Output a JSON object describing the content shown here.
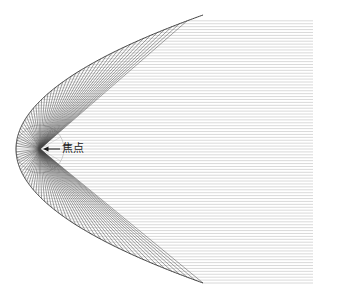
{
  "figure": {
    "kind": "parabolic-reflector-ray-diagram",
    "background_color": "#ffffff",
    "width": 338,
    "height": 297
  },
  "labels": {
    "focus_label": "焦点",
    "focus_label_x": 62,
    "focus_label_y": 149,
    "arrow_tip_x": 43,
    "arrow_tail_x": 60,
    "arrow_y": 149,
    "arrow_color": "#1a1a1a"
  },
  "chart_data": {
    "type": "line",
    "title": "",
    "subtitle": "",
    "xlabel": "",
    "ylabel": "",
    "grid": false,
    "legend": "none",
    "annotations": [
      {
        "text": "焦点",
        "x": 40,
        "y": 149,
        "arrow": "left-pointing",
        "label_offset_x": 22
      }
    ],
    "geometry": {
      "parabola": {
        "vertex_x": 16,
        "vertex_y": 149,
        "focus_x": 40,
        "focus_y": 149,
        "focal_length": 24,
        "opens": "right",
        "axis": "horizontal",
        "right_edge_x": 313,
        "top_y": 20,
        "bottom_y": 283,
        "equation": "y^2 = 4 * 24 * (x - 16)",
        "stroke": "#2b2b2b",
        "stroke_width": 0.9
      },
      "focus_circle": {
        "center_x": 40,
        "center_y": 149,
        "radius": 24,
        "stroke": "#9a9a9a",
        "stroke_width": 0.5,
        "note": "construction circle of radius = focal length centred on focus"
      },
      "incoming_rays": {
        "description": "horizontal parallel rays travelling leftwards toward the reflector",
        "count": 46,
        "x_start": 313,
        "spacing_y": 11.4,
        "y_min": 20,
        "y_max": 283,
        "stroke": "#b9b9b9",
        "stroke_width": 0.55
      },
      "reflected_rays": {
        "description": "each incoming ray reflects off the parabola and passes through the focus",
        "count": 46,
        "converge_x": 40,
        "converge_y": 149,
        "stroke": "#444444",
        "stroke_width": 0.5
      },
      "construction_lines": {
        "description": "faint radial spokes from focus to the construction circle",
        "count": 12,
        "stroke": "#b0b0b0",
        "stroke_width": 0.4
      }
    },
    "colors": {
      "curve": "#2b2b2b",
      "incoming_ray": "#b9b9b9",
      "reflected_ray": "#444444",
      "construction": "#b0b0b0",
      "label": "#1a1a1a",
      "background": "#ffffff"
    }
  }
}
